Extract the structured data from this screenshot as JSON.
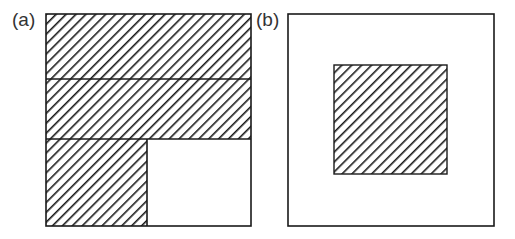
{
  "figure": {
    "panels": [
      {
        "id": "a",
        "label": "(a)",
        "description": "Square divided into two full-width hatched horizontal strips on top and a bottom row split into a hatched left cell and an empty right cell",
        "regions": [
          {
            "name": "top-strip",
            "hatched": true
          },
          {
            "name": "middle-strip",
            "hatched": true
          },
          {
            "name": "bottom-left-cell",
            "hatched": true
          },
          {
            "name": "bottom-right-cell",
            "hatched": false
          }
        ]
      },
      {
        "id": "b",
        "label": "(b)",
        "description": "Empty square containing a centered hatched square",
        "regions": [
          {
            "name": "outer-square",
            "hatched": false
          },
          {
            "name": "inner-square",
            "hatched": true
          }
        ]
      }
    ],
    "colors": {
      "stroke": "#1a1a1a",
      "hatch": "#1a1a1a",
      "background": "#ffffff",
      "label": "#333333"
    }
  }
}
